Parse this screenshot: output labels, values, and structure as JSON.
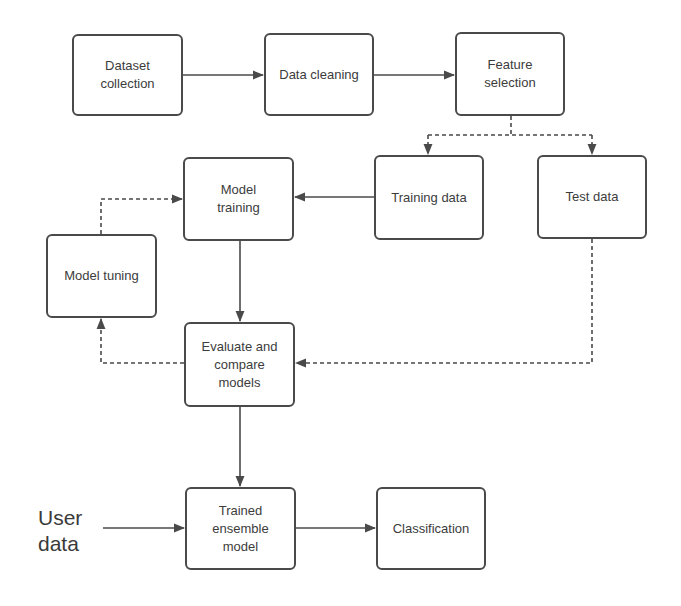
{
  "diagram": {
    "nodes": [
      {
        "id": "dataset_collection",
        "label": "Dataset\ncollection",
        "x": 72,
        "y": 34,
        "w": 111,
        "h": 82
      },
      {
        "id": "data_cleaning",
        "label": "Data cleaning",
        "x": 264,
        "y": 33,
        "w": 110,
        "h": 83
      },
      {
        "id": "feature_selection",
        "label": "Feature\nselection",
        "x": 455,
        "y": 32,
        "w": 110,
        "h": 84
      },
      {
        "id": "model_training",
        "label": "Model\ntraining",
        "x": 183,
        "y": 157,
        "w": 111,
        "h": 84
      },
      {
        "id": "training_data",
        "label": "Training data",
        "x": 374,
        "y": 155,
        "w": 110,
        "h": 85
      },
      {
        "id": "test_data",
        "label": "Test data",
        "x": 537,
        "y": 155,
        "w": 110,
        "h": 84
      },
      {
        "id": "model_tuning",
        "label": "Model tuning",
        "x": 46,
        "y": 234,
        "w": 111,
        "h": 84
      },
      {
        "id": "evaluate_compare",
        "label": "Evaluate and\ncompare\nmodels",
        "x": 184,
        "y": 322,
        "w": 111,
        "h": 85
      },
      {
        "id": "trained_ensemble",
        "label": "Trained\nensemble\nmodel",
        "x": 185,
        "y": 487,
        "w": 111,
        "h": 83
      },
      {
        "id": "classification",
        "label": "Classification",
        "x": 376,
        "y": 487,
        "w": 110,
        "h": 83
      }
    ],
    "input_label": "User\ndata",
    "edges": [
      {
        "from": "dataset_collection",
        "to": "data_cleaning",
        "style": "solid"
      },
      {
        "from": "data_cleaning",
        "to": "feature_selection",
        "style": "solid"
      },
      {
        "from": "feature_selection",
        "to": "training_data",
        "style": "dashed"
      },
      {
        "from": "feature_selection",
        "to": "test_data",
        "style": "dashed"
      },
      {
        "from": "training_data",
        "to": "model_training",
        "style": "solid"
      },
      {
        "from": "model_training",
        "to": "evaluate_compare",
        "style": "solid"
      },
      {
        "from": "test_data",
        "to": "evaluate_compare",
        "style": "dashed"
      },
      {
        "from": "evaluate_compare",
        "to": "model_tuning",
        "style": "dashed"
      },
      {
        "from": "model_tuning",
        "to": "model_training",
        "style": "dashed"
      },
      {
        "from": "evaluate_compare",
        "to": "trained_ensemble",
        "style": "solid"
      },
      {
        "from": "user_data",
        "to": "trained_ensemble",
        "style": "solid"
      },
      {
        "from": "trained_ensemble",
        "to": "classification",
        "style": "solid"
      }
    ],
    "colors": {
      "stroke": "#4a4a4a",
      "text": "#3c3c3c",
      "background": "#ffffff"
    }
  }
}
